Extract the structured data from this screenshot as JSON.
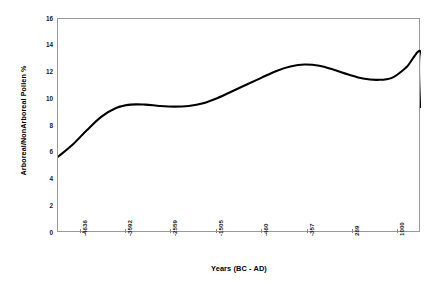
{
  "chart_data": {
    "type": "line",
    "title": "",
    "xlabel": "Years (BC - AD)",
    "ylabel": "Arboreal/NonArboreal Pollen %",
    "grid": false,
    "legend": false,
    "ylim": [
      0,
      16
    ],
    "ytick_labels": [
      "16",
      "14",
      "12",
      "10",
      "8",
      "6",
      "4",
      "2",
      "0"
    ],
    "ytick_values": [
      16,
      14,
      12,
      10,
      8,
      6,
      4,
      2,
      0
    ],
    "xtick_labels": [
      "-4636",
      "-3592",
      "-2559",
      "-1505",
      "-460",
      "-357",
      "269",
      "1000"
    ],
    "line_color": "#000000",
    "series": [
      {
        "name": "Arboreal/NonArboreal Pollen %",
        "x": [
          "-4636",
          "-3592",
          "-2559",
          "-1505",
          "-460",
          "-357",
          "269",
          "1000"
        ],
        "x_index": [
          0,
          1,
          2,
          3,
          4,
          5,
          6,
          7
        ],
        "values": [
          5.7,
          9.5,
          9.5,
          11.2,
          12.6,
          11.5,
          13.2,
          9.4
        ],
        "sampled_x_frac": [
          0.0,
          0.04,
          0.08,
          0.12,
          0.16,
          0.2,
          0.24,
          0.28,
          0.32,
          0.36,
          0.4,
          0.44,
          0.48,
          0.52,
          0.56,
          0.6,
          0.64,
          0.68,
          0.72,
          0.76,
          0.8,
          0.84,
          0.88,
          0.92,
          0.96,
          1.0
        ],
        "sampled_values": [
          5.7,
          6.6,
          7.7,
          8.7,
          9.35,
          9.6,
          9.6,
          9.5,
          9.45,
          9.5,
          9.7,
          10.1,
          10.6,
          11.1,
          11.6,
          12.1,
          12.45,
          12.6,
          12.5,
          12.2,
          11.85,
          11.55,
          11.45,
          11.6,
          12.4,
          13.5
        ]
      }
    ],
    "annotations": []
  },
  "axes": {
    "y_title": "Arboreal/NonArboreal Pollen %",
    "x_title": "Years (BC - AD)"
  }
}
